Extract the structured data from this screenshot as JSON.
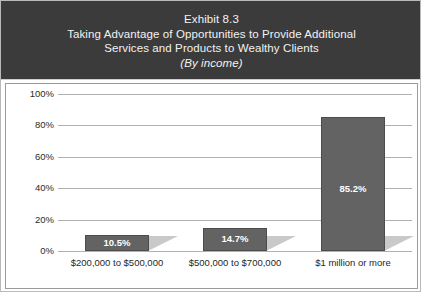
{
  "title": {
    "line1": "Exhibit 8.3",
    "line2": "Taking Advantage of Opportunities to Provide Additional",
    "line3": "Services and Products to Wealthy Clients",
    "line4": "(By income)"
  },
  "colors": {
    "title_band": "#3b3b3b",
    "title_text": "#f2f2f2",
    "bar_fill": "#636363",
    "bar_edge": "#4c4c4c",
    "bar_shadow": "#c9c9c9",
    "gridline": "#b0b0b0",
    "frame": "#9a9a9a",
    "value_label": "#ffffff"
  },
  "chart_data": {
    "type": "bar",
    "title": "Exhibit 8.3 Taking Advantage of Opportunities to Provide Additional Services and Products to Wealthy Clients (By income)",
    "subtitle": "(By income)",
    "xlabel": "",
    "ylabel": "",
    "categories": [
      "$200,000 to $500,000",
      "$500,000 to $700,000",
      "$1 million or more"
    ],
    "values": [
      10.5,
      14.7,
      85.2
    ],
    "value_labels": [
      "10.5%",
      "14.7%",
      "85.2%"
    ],
    "ylim": [
      0,
      100
    ],
    "yticks": [
      0,
      20,
      40,
      60,
      80,
      100
    ],
    "ytick_labels": [
      "0%",
      "20%",
      "40%",
      "60%",
      "80%",
      "100%"
    ],
    "grid": true,
    "legend": false,
    "legend_position": "none"
  }
}
